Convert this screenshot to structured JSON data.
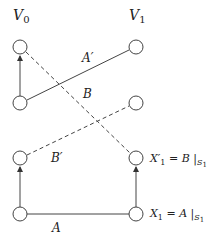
{
  "headers": {
    "v0": {
      "main": "V",
      "sub": "0"
    },
    "v1": {
      "main": "V",
      "sub": "1"
    }
  },
  "edge_labels": {
    "a_prime": "A′",
    "b": "B",
    "b_prime": "B′",
    "a": "A"
  },
  "node_labels": {
    "x1_prime": {
      "main": "X′",
      "sub": "1",
      "rest": " = B |",
      "cond": "S",
      "cond_sub": "1"
    },
    "x1": {
      "main": "X",
      "sub": "1",
      "rest": " = A |",
      "cond": "S",
      "cond_sub": "1"
    }
  },
  "colors": {
    "stroke": "#444444",
    "text": "#222222",
    "background": "#ffffff"
  }
}
